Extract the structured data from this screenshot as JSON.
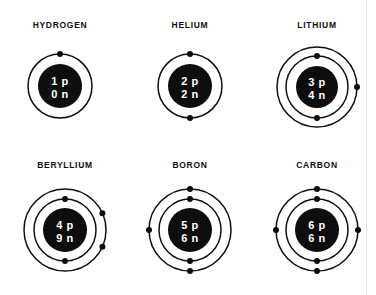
{
  "figure": {
    "title_visible": false,
    "background_color": "#ffffff",
    "ink_color": "#0d0d0d",
    "nucleus_text_color": "#ffffff",
    "columns": 3,
    "rows": 2
  },
  "atoms": [
    {
      "label": "HYDROGEN",
      "protons": "1 p",
      "neutrons": "0 n",
      "shells": 1,
      "shell_electrons": [
        1
      ],
      "electron_positions": [
        [
          "top"
        ]
      ],
      "cx": 60,
      "cy": 86,
      "nucleus_r": 22,
      "shell_radii": [
        32
      ],
      "label_x": 0,
      "label_y": 20,
      "cell_x": 0,
      "cell_y": 20
    },
    {
      "label": "HELIUM",
      "protons": "2 p",
      "neutrons": "2 n",
      "shells": 1,
      "shell_electrons": [
        2
      ],
      "electron_positions": [
        [
          "top",
          "bottom"
        ]
      ],
      "cx": 190,
      "cy": 86,
      "nucleus_r": 22,
      "shell_radii": [
        32
      ],
      "label_x": 130,
      "label_y": 20,
      "cell_x": 130,
      "cell_y": 20
    },
    {
      "label": "LITHIUM",
      "protons": "3 p",
      "neutrons": "4 n",
      "shells": 2,
      "shell_electrons": [
        2,
        1
      ],
      "electron_positions": [
        [
          "top",
          "bottom"
        ],
        [
          "right"
        ]
      ],
      "cx": 317,
      "cy": 87,
      "nucleus_r": 21,
      "shell_radii": [
        31,
        40
      ],
      "label_x": 257,
      "label_y": 20,
      "cell_x": 257,
      "cell_y": 20
    },
    {
      "label": "BERYLLIUM",
      "protons": "4 p",
      "neutrons": "9 n",
      "shells": 2,
      "shell_electrons": [
        2,
        2
      ],
      "electron_positions": [
        [
          "top",
          "bottom"
        ],
        [
          "upper-right",
          "lower-right"
        ]
      ],
      "cx": 65,
      "cy": 230,
      "nucleus_r": 22,
      "shell_radii": [
        31,
        41
      ],
      "label_x": 5,
      "label_y": 160,
      "cell_x": 5,
      "cell_y": 160
    },
    {
      "label": "BORON",
      "protons": "5 p",
      "neutrons": "6 n",
      "shells": 2,
      "shell_electrons": [
        2,
        3
      ],
      "electron_positions": [
        [
          "top",
          "bottom"
        ],
        [
          "top",
          "left",
          "bottom"
        ]
      ],
      "cx": 190,
      "cy": 230,
      "nucleus_r": 22,
      "shell_radii": [
        31,
        41
      ],
      "label_x": 130,
      "label_y": 160,
      "cell_x": 130,
      "cell_y": 160
    },
    {
      "label": "CARBON",
      "protons": "6 p",
      "neutrons": "6 n",
      "shells": 2,
      "shell_electrons": [
        2,
        4
      ],
      "electron_positions": [
        [
          "top",
          "bottom"
        ],
        [
          "top",
          "right",
          "bottom",
          "left"
        ]
      ],
      "cx": 317,
      "cy": 230,
      "nucleus_r": 22,
      "shell_radii": [
        31,
        41
      ],
      "label_x": 257,
      "label_y": 160,
      "cell_x": 257,
      "cell_y": 160
    }
  ]
}
